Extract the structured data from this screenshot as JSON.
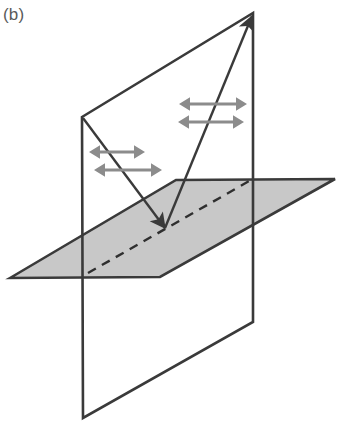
{
  "figure": {
    "panel_label": "(b)",
    "caption_text": "(b)",
    "background_color": "#ffffff"
  },
  "style": {
    "stroke_dark": "#3a3a3a",
    "stroke_dark_light": "#4a4a4a",
    "label_color": "#5a5a5a",
    "plane_fill": "#c8c8c8",
    "plane_fill_opacity": "1",
    "arrow_grey": "#8c8c8c",
    "line_width_plane": "2.6",
    "line_width_ray": "2.4",
    "line_width_dash": "2.4",
    "dash_pattern": "9 7"
  },
  "geometry": {
    "vertical_plane": {
      "name": "plane-of-incidence",
      "points": "82,117 253,13 253,322 83,418",
      "fill": "none"
    },
    "horizontal_plane": {
      "name": "reflecting-surface",
      "points": "10,278 176,180 335,179 160,277",
      "fill": "#c8c8c8"
    },
    "intersection_dashed_line": {
      "name": "plane-intersection-line",
      "x1": 88,
      "y1": 273,
      "x2": 251,
      "y2": 180
    },
    "incident_ray": {
      "name": "incident-ray",
      "x1": 83,
      "y1": 118,
      "x2": 165,
      "y2": 228,
      "arrow_at": "end"
    },
    "reflected_ray": {
      "name": "reflected-ray",
      "x1": 165,
      "y1": 228,
      "x2": 252,
      "y2": 16,
      "arrow_at": "end"
    },
    "incidence_point": {
      "x": 165,
      "y": 228
    },
    "polarization_arrows": [
      {
        "name": "incident-polarization-arrow-upper",
        "cx": 117,
        "cy": 152,
        "half_len": 28,
        "head": 11,
        "shaft": 3
      },
      {
        "name": "incident-polarization-arrow-lower",
        "cx": 128,
        "cy": 170,
        "half_len": 34,
        "head": 11,
        "shaft": 3
      },
      {
        "name": "reflected-polarization-arrow-upper",
        "cx": 213,
        "cy": 104,
        "half_len": 34,
        "head": 11,
        "shaft": 3
      },
      {
        "name": "reflected-polarization-arrow-lower",
        "cx": 211,
        "cy": 122,
        "half_len": 33,
        "head": 11,
        "shaft": 3
      }
    ]
  },
  "chart_data": {
    "type": "diagram",
    "title": "(b)",
    "elements": [
      {
        "label": "plane of incidence (vertical plane)",
        "kind": "quadrilateral-outline"
      },
      {
        "label": "reflecting surface (shaded horizontal plane)",
        "kind": "filled-parallelogram"
      },
      {
        "label": "intersection of planes",
        "kind": "dashed-line"
      },
      {
        "label": "incident ray",
        "kind": "arrow"
      },
      {
        "label": "reflected ray",
        "kind": "arrow"
      },
      {
        "label": "polarization direction indicators",
        "kind": "double-headed-arrows",
        "count": 4
      }
    ]
  }
}
